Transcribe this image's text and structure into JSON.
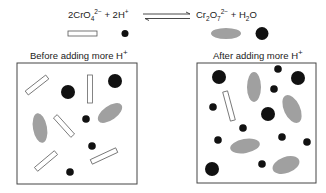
{
  "equation": {
    "reactant_1": {
      "coef": "2CrO",
      "sub": "4",
      "sup": "2−"
    },
    "plus_1": "+",
    "reactant_2": {
      "coef": "2H",
      "sup": "+"
    },
    "product_1": {
      "base": "Cr",
      "sub1": "2",
      "mid": "O",
      "sub2": "7",
      "sup": "2−"
    },
    "plus_2": "+",
    "product_2": {
      "base": "H",
      "sub": "2",
      "tail": "O"
    }
  },
  "legend": {
    "chromate": "open-rectangle",
    "h_ion": "small-black-dot",
    "dichromate": "gray-ellipse",
    "water": "large-black-dot"
  },
  "panels": [
    {
      "title": "Before adding more H",
      "title_sup": "+"
    },
    {
      "title": "After adding more H",
      "title_sup": "+"
    }
  ],
  "colors": {
    "dichromate_fill": "#a0a0a0",
    "dot": "#111111",
    "border": "#444444"
  }
}
